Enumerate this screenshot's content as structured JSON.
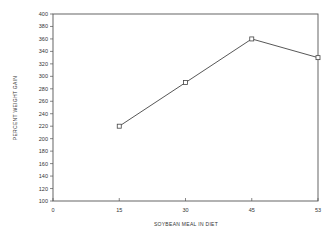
{
  "chart_data": {
    "type": "line",
    "title": "",
    "xlabel": "SOYBEAN MEAL IN DIET",
    "ylabel": "PERCENT WEIGHT GAIN",
    "x_tick_labels": [
      "0",
      "15",
      "30",
      "45",
      "53"
    ],
    "categories": [
      "15",
      "30",
      "45",
      "53"
    ],
    "series": [
      {
        "name": "Percent weight gain",
        "marker": "open-square",
        "values": [
          220,
          290,
          360,
          330
        ]
      }
    ],
    "ylim": [
      100,
      400
    ],
    "y_ticks": [
      100,
      120,
      140,
      160,
      180,
      200,
      220,
      240,
      260,
      280,
      300,
      320,
      340,
      360,
      380,
      400
    ],
    "grid": false,
    "legend": "none"
  },
  "colors": {
    "axis": "#555555",
    "line": "#444444",
    "text": "#333333"
  }
}
